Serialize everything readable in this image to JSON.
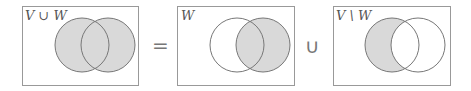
{
  "panels": [
    {
      "label": "V ∪ W",
      "shaded": "union"
    },
    {
      "label": "W",
      "shaded": "right"
    },
    {
      "label": "V \\ W",
      "shaded": "left-only"
    }
  ],
  "operators": [
    "=",
    "∪"
  ],
  "colors": {
    "fill": "#d9d9d9",
    "stroke": "#777777",
    "box": "#999999"
  }
}
